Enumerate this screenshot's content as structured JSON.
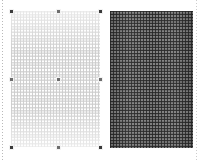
{
  "canvas": {
    "width": 204,
    "height": 160,
    "background_color": "#ffffff",
    "guide_color": "#b9b9b9"
  },
  "swatches": [
    {
      "id": "swatch-light",
      "name": "Light woven texture swatch",
      "selected": true,
      "x": 11,
      "y": 11,
      "width": 89,
      "height": 136,
      "base_color": "#fdfdfd",
      "weave_color": "#cdcdcd",
      "pattern": "basket-weave",
      "cell_size_px": 3
    },
    {
      "id": "swatch-dark",
      "name": "Dark woven texture swatch",
      "selected": false,
      "x": 110,
      "y": 11,
      "width": 83,
      "height": 137,
      "base_color": "#6f6f6f",
      "weave_color": "#262626",
      "pattern": "basket-weave",
      "cell_size_px": 3
    }
  ],
  "selection": {
    "target": "swatch-light",
    "handle_color": "#3a3a3a",
    "handles": [
      {
        "name": "handle-top-left",
        "x": 11,
        "y": 11,
        "corner": true
      },
      {
        "name": "handle-top-center",
        "x": 58,
        "y": 11,
        "corner": false
      },
      {
        "name": "handle-top-right",
        "x": 100,
        "y": 11,
        "corner": true
      },
      {
        "name": "handle-middle-left",
        "x": 11,
        "y": 79,
        "corner": false
      },
      {
        "name": "handle-middle-center",
        "x": 58,
        "y": 79,
        "corner": false
      },
      {
        "name": "handle-middle-right",
        "x": 100,
        "y": 79,
        "corner": false
      },
      {
        "name": "handle-bottom-left",
        "x": 11,
        "y": 147,
        "corner": true
      },
      {
        "name": "handle-bottom-center",
        "x": 58,
        "y": 147,
        "corner": false
      },
      {
        "name": "handle-bottom-right",
        "x": 100,
        "y": 147,
        "corner": true
      }
    ]
  },
  "guides": [
    {
      "name": "guide-left",
      "x": 2,
      "orientation": "vertical"
    },
    {
      "name": "guide-right",
      "x": 196,
      "orientation": "vertical"
    }
  ]
}
